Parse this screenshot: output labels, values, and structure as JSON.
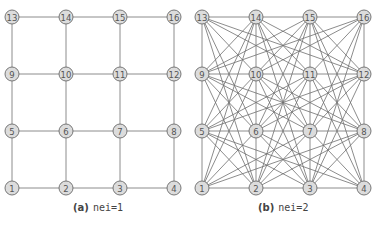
{
  "figure": {
    "panels": [
      {
        "id": "a",
        "caption_label": "(a)",
        "caption_text": "nei=1",
        "rule": "nei1",
        "origin_x": 12,
        "col_spacing": 54,
        "caption_x": 73
      },
      {
        "id": "b",
        "caption_label": "(b)",
        "caption_text": "nei=2",
        "rule": "nei2",
        "origin_x": 202,
        "col_spacing": 54,
        "caption_x": 258
      }
    ],
    "rows_y": [
      188,
      131,
      74,
      17
    ],
    "node_radius": 7,
    "grid": {
      "cols": 4,
      "rows": 4
    },
    "node_labels": [
      "1",
      "2",
      "3",
      "4",
      "5",
      "6",
      "7",
      "8",
      "9",
      "10",
      "11",
      "12",
      "13",
      "14",
      "15",
      "16"
    ],
    "colors": {
      "node_fill": "#dcdcdc",
      "node_stroke": "#6a6a6a",
      "edge": "#6e6e6e",
      "label": "#555555"
    }
  }
}
